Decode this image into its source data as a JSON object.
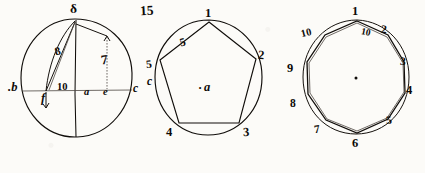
{
  "page": {
    "figure_number": "15",
    "background_color": "#fcfbf8",
    "ink_color": "#100d0a",
    "medium": "ink-on-paper manuscript drawing"
  },
  "figures": [
    {
      "id": "figure-circle-with-chords",
      "type": "circle",
      "description": "Circle with vertical diameter, horizontal diameter, a chord and a short perpendicular segment",
      "labels": [
        {
          "name": "label-delta-top",
          "text": "δ",
          "position": "top vertex of vertical diameter"
        },
        {
          "name": "label-b-left",
          "text": ".b",
          "position": "left of circle outside"
        },
        {
          "name": "label-c-right",
          "text": "c",
          "position": "right of circle outside"
        },
        {
          "name": "label-f-lower",
          "text": "f",
          "position": "below left end of chord on horizontal line"
        },
        {
          "name": "label-ten",
          "text": "10",
          "position": "on horizontal diameter left of centre"
        },
        {
          "name": "label-a-centre",
          "text": "a",
          "position": "centre of circle"
        },
        {
          "name": "label-e-right-foot",
          "text": "e",
          "position": "on horizontal diameter right of centre"
        },
        {
          "name": "label-eight-chord",
          "text": "8",
          "position": "along the slanted chord"
        },
        {
          "name": "label-seven-vert",
          "text": "7",
          "position": "along the right vertical segment"
        }
      ]
    },
    {
      "id": "figure-inscribed-pentagon",
      "type": "regular-polygon",
      "sides": 5,
      "description": "Regular pentagon inscribed in a circle, vertices numbered clockwise from the top",
      "vertex_labels": [
        "1",
        "2",
        "3",
        "4",
        "5"
      ],
      "labels": [
        {
          "name": "pentagon-vertex-1",
          "text": "1",
          "position": "top"
        },
        {
          "name": "pentagon-vertex-2",
          "text": "2",
          "position": "upper right"
        },
        {
          "name": "pentagon-vertex-3",
          "text": "3",
          "position": "lower right"
        },
        {
          "name": "pentagon-vertex-4",
          "text": "4",
          "position": "lower left"
        },
        {
          "name": "pentagon-vertex-5",
          "text": "5",
          "position": "upper left"
        },
        {
          "name": "pentagon-edge-5",
          "text": "5",
          "position": "on the upper-left edge"
        },
        {
          "name": "pentagon-centre",
          "text": "a",
          "position": "centre, preceded by a dot"
        },
        {
          "name": "pentagon-side-c",
          "text": "c",
          "position": "outside the left vertex, below"
        }
      ]
    },
    {
      "id": "figure-inscribed-decagon",
      "type": "regular-polygon",
      "sides": 10,
      "description": "Regular decagon inscribed in a circle, vertices numbered clockwise from the top",
      "vertex_labels": [
        "1",
        "2",
        "3",
        "4",
        "5",
        "6",
        "7",
        "8",
        "9",
        "10"
      ],
      "labels": [
        {
          "name": "decagon-vertex-1",
          "text": "1",
          "position": "top"
        },
        {
          "name": "decagon-vertex-2",
          "text": "2",
          "position": "upper right"
        },
        {
          "name": "decagon-vertex-3",
          "text": "3",
          "position": "right upper"
        },
        {
          "name": "decagon-vertex-4",
          "text": "4",
          "position": "right"
        },
        {
          "name": "decagon-vertex-5",
          "text": "5",
          "position": "lower right"
        },
        {
          "name": "decagon-vertex-6",
          "text": "6",
          "position": "bottom"
        },
        {
          "name": "decagon-vertex-7",
          "text": "7",
          "position": "lower left"
        },
        {
          "name": "decagon-vertex-8",
          "text": "8",
          "position": "left lower"
        },
        {
          "name": "decagon-vertex-9",
          "text": "9",
          "position": "left"
        },
        {
          "name": "decagon-vertex-10",
          "text": "10",
          "position": "upper left"
        },
        {
          "name": "decagon-inner-10",
          "text": "10",
          "position": "inside near the top-right, under vertex 1"
        },
        {
          "name": "decagon-centre-dot",
          "text": "",
          "position": "small dot at centre"
        }
      ]
    }
  ]
}
